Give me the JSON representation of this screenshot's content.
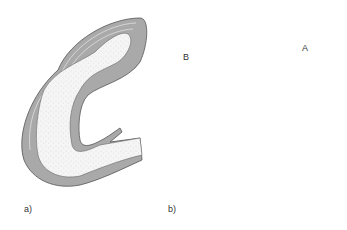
{
  "figure": {
    "panels": [
      {
        "id": "a",
        "label": "a)"
      },
      {
        "id": "b",
        "label": "b)"
      }
    ],
    "callouts": [
      {
        "id": "B",
        "label": "B"
      },
      {
        "id": "A",
        "label": "A"
      }
    ],
    "colors": {
      "wall": "#a9a9a9",
      "wall_dark": "#7d7d7d",
      "outline": "#555555",
      "lumen": "#f4f4f4",
      "stipple": "#9a9a9a",
      "cavity": "#6e6e6e"
    }
  }
}
